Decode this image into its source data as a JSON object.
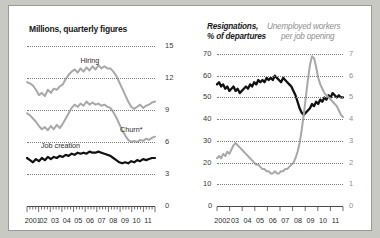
{
  "chart_data": [
    {
      "type": "line",
      "title": "Millions, quarterly figures",
      "xlabel": "",
      "ylabel": "",
      "ylim": [
        0,
        15
      ],
      "yticks": [
        0,
        3,
        6,
        9,
        12,
        15
      ],
      "ytick_labels": [
        "0",
        "3",
        "6",
        "9",
        "12",
        "15"
      ],
      "yaxis_position": "right",
      "grid": true,
      "xlim": [
        2001,
        2012
      ],
      "xtick_labels": [
        "2001",
        "02",
        "03",
        "04",
        "05",
        "06",
        "07",
        "08",
        "09",
        "10",
        "11"
      ],
      "series": [
        {
          "name": "Hiring",
          "color": "#a8a8a8",
          "label_x": 2005.6,
          "label_y": 13.6,
          "values": [
            11.6,
            11.5,
            11.3,
            10.9,
            10.4,
            10.6,
            10.3,
            10.9,
            10.6,
            11.0,
            10.9,
            11.2,
            11.4,
            11.9,
            12.3,
            12.6,
            12.8,
            12.5,
            12.9,
            12.6,
            13.0,
            12.7,
            13.1,
            12.8,
            13.2,
            12.9,
            13.1,
            12.9,
            12.9,
            12.6,
            12.2,
            11.6,
            11.0,
            10.4,
            9.8,
            9.3,
            9.1,
            9.3,
            9.5,
            9.2,
            9.4,
            9.5,
            9.7,
            9.8
          ]
        },
        {
          "name": "Churn*",
          "color": "#a8a8a8",
          "label_x": 2009.0,
          "label_y": 7.1,
          "values": [
            8.7,
            8.5,
            8.2,
            7.9,
            7.5,
            7.2,
            7.4,
            7.1,
            7.5,
            7.2,
            7.6,
            7.3,
            7.7,
            8.2,
            8.7,
            9.2,
            9.5,
            9.3,
            9.6,
            9.4,
            9.8,
            9.5,
            9.7,
            9.5,
            9.6,
            9.4,
            9.5,
            9.3,
            9.2,
            8.8,
            8.3,
            7.7,
            7.1,
            6.6,
            6.2,
            6.0,
            6.1,
            6.0,
            6.2,
            6.1,
            6.3,
            6.2,
            6.4,
            6.5
          ]
        },
        {
          "name": "Job creation",
          "color": "#111111",
          "label_x": 2002.2,
          "label_y": 5.6,
          "values": [
            4.5,
            4.3,
            4.1,
            4.4,
            4.2,
            4.5,
            4.3,
            4.6,
            4.4,
            4.6,
            4.5,
            4.7,
            4.6,
            4.8,
            4.7,
            4.9,
            4.8,
            5.0,
            4.9,
            5.0,
            4.9,
            5.1,
            5.0,
            5.0,
            5.1,
            5.0,
            4.9,
            4.8,
            4.7,
            4.5,
            4.3,
            4.1,
            4.0,
            4.1,
            4.0,
            4.2,
            4.1,
            4.3,
            4.2,
            4.4,
            4.3,
            4.4,
            4.5,
            4.5
          ]
        }
      ]
    },
    {
      "type": "line",
      "title_black": "Resignations,",
      "title_black2": "% of departures",
      "title_gray": "Unemployed workers",
      "title_gray2": "per job opening",
      "xlabel": "",
      "grid": true,
      "ylim_left": [
        0,
        70
      ],
      "yticks_left": [
        0,
        10,
        20,
        30,
        40,
        50,
        60,
        70
      ],
      "ytick_labels_left": [
        "0",
        "10",
        "20",
        "30",
        "40",
        "50",
        "60",
        "70"
      ],
      "ylim_right": [
        0,
        7
      ],
      "yticks_right": [
        0,
        1,
        2,
        3,
        4,
        5,
        6,
        7
      ],
      "ytick_labels_right": [
        "0",
        "1",
        "2",
        "3",
        "4",
        "5",
        "6",
        "7"
      ],
      "xlim": [
        2002,
        2012
      ],
      "xtick_labels": [
        "2002",
        "03",
        "04",
        "05",
        "06",
        "07",
        "08",
        "09",
        "10",
        "11"
      ],
      "series": [
        {
          "name": "Resignations, % of departures",
          "axis": "left",
          "color": "#111111",
          "values": [
            56,
            57,
            55,
            56,
            54,
            55,
            53,
            54,
            55,
            53,
            54,
            52,
            53,
            54,
            55,
            54,
            56,
            55,
            57,
            56,
            58,
            57,
            58,
            57,
            59,
            58,
            59,
            58,
            60,
            59,
            58,
            57,
            59,
            58,
            57,
            56,
            55,
            53,
            51,
            48,
            45,
            43,
            42,
            43,
            44,
            45,
            47,
            46,
            48,
            47,
            49,
            48,
            50,
            49,
            51,
            50,
            52,
            51,
            50,
            51,
            50,
            50
          ]
        },
        {
          "name": "Unemployed workers per job opening",
          "axis": "right",
          "color": "#a8a8a8",
          "values": [
            2.2,
            2.3,
            2.2,
            2.4,
            2.3,
            2.5,
            2.4,
            2.6,
            2.8,
            2.9,
            2.8,
            2.7,
            2.6,
            2.5,
            2.4,
            2.3,
            2.2,
            2.1,
            2.0,
            1.9,
            1.9,
            1.8,
            1.7,
            1.7,
            1.6,
            1.6,
            1.5,
            1.5,
            1.6,
            1.5,
            1.5,
            1.6,
            1.6,
            1.7,
            1.7,
            1.8,
            1.9,
            2.0,
            2.2,
            2.5,
            2.9,
            3.5,
            4.2,
            5.0,
            5.8,
            6.5,
            6.9,
            6.8,
            6.4,
            5.9,
            5.6,
            5.4,
            5.2,
            5.1,
            5.0,
            4.9,
            4.8,
            4.7,
            4.6,
            4.4,
            4.2,
            4.1
          ]
        }
      ]
    }
  ]
}
